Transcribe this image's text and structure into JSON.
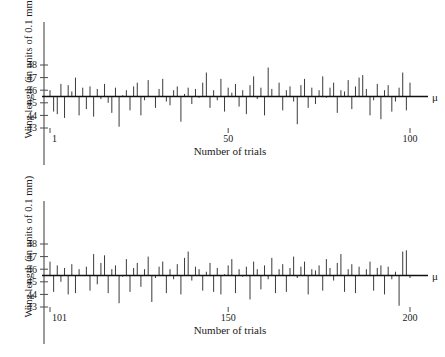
{
  "figure": {
    "type": "stem-plot-pair",
    "xlabel": "Number of trials",
    "ylabel": "Wing length (in units of 0.1 mm)",
    "mean_symbol": "μ",
    "line_color": "#3a3a3a",
    "axis_color": "#4a4a4a"
  },
  "chart_data": [
    {
      "type": "bar",
      "panel": "top",
      "title": "",
      "xlabel": "Number of trials",
      "ylabel": "Wing length (in units of 0.1 mm)",
      "xlim": [
        1,
        100
      ],
      "ylim": [
        43,
        48
      ],
      "baseline": 45.5,
      "baseline_label": "μ",
      "grid": false,
      "legend": null,
      "xticks": [
        1,
        50,
        100
      ],
      "xticklabels": [
        "1",
        "50",
        "100"
      ],
      "yticks": [
        43,
        44,
        45,
        46,
        47,
        48
      ],
      "yticklabels": [
        "43",
        "44",
        "45",
        "46",
        "47",
        "48"
      ],
      "categories": [
        1,
        2,
        3,
        4,
        5,
        6,
        7,
        8,
        9,
        10,
        11,
        12,
        13,
        14,
        15,
        16,
        17,
        18,
        19,
        20,
        21,
        22,
        23,
        24,
        25,
        26,
        27,
        28,
        29,
        30,
        31,
        32,
        33,
        34,
        35,
        36,
        37,
        38,
        39,
        40,
        41,
        42,
        43,
        44,
        45,
        46,
        47,
        48,
        49,
        50,
        51,
        52,
        53,
        54,
        55,
        56,
        57,
        58,
        59,
        60,
        61,
        62,
        63,
        64,
        65,
        66,
        67,
        68,
        69,
        70,
        71,
        72,
        73,
        74,
        75,
        76,
        77,
        78,
        79,
        80,
        81,
        82,
        83,
        84,
        85,
        86,
        87,
        88,
        89,
        90,
        91,
        92,
        93,
        94,
        95,
        96,
        97,
        98,
        99,
        100
      ],
      "values": [
        46.0,
        44.3,
        44.1,
        46.5,
        43.8,
        46.4,
        45.9,
        47.0,
        44.0,
        46.2,
        44.5,
        46.3,
        43.9,
        46.1,
        45.3,
        46.5,
        45.0,
        44.2,
        46.2,
        43.1,
        45.6,
        46.0,
        44.4,
        46.3,
        46.6,
        44.0,
        45.2,
        46.8,
        45.5,
        44.6,
        46.1,
        46.9,
        45.1,
        44.8,
        46.0,
        46.3,
        43.5,
        45.7,
        46.2,
        44.9,
        46.1,
        45.4,
        46.6,
        47.4,
        44.6,
        46.0,
        45.2,
        46.9,
        44.3,
        46.2,
        45.8,
        46.5,
        44.7,
        46.0,
        44.1,
        46.4,
        47.1,
        45.3,
        46.2,
        44.0,
        47.8,
        46.1,
        45.5,
        46.6,
        44.4,
        46.0,
        46.3,
        45.1,
        43.3,
        46.4,
        46.9,
        44.6,
        46.2,
        44.9,
        46.0,
        47.1,
        45.4,
        46.2,
        46.6,
        44.2,
        46.0,
        45.9,
        46.8,
        44.5,
        46.3,
        47.0,
        47.2,
        46.1,
        44.0,
        45.2,
        46.5,
        43.7,
        46.0,
        46.4,
        44.3,
        45.1,
        46.2,
        47.4,
        44.4,
        46.6
      ]
    },
    {
      "type": "bar",
      "panel": "bottom",
      "title": "",
      "xlabel": "Number of trials",
      "ylabel": "Wing length (in units of 0.1 mm)",
      "xlim": [
        101,
        200
      ],
      "ylim": [
        43,
        48
      ],
      "baseline": 45.5,
      "baseline_label": "μ",
      "grid": false,
      "legend": null,
      "xticks": [
        101,
        150,
        200
      ],
      "xticklabels": [
        "101",
        "150",
        "200"
      ],
      "yticks": [
        43,
        44,
        45,
        46,
        47,
        48
      ],
      "yticklabels": [
        "43",
        "44",
        "45",
        "46",
        "47",
        "48"
      ],
      "categories": [
        101,
        102,
        103,
        104,
        105,
        106,
        107,
        108,
        109,
        110,
        111,
        112,
        113,
        114,
        115,
        116,
        117,
        118,
        119,
        120,
        121,
        122,
        123,
        124,
        125,
        126,
        127,
        128,
        129,
        130,
        131,
        132,
        133,
        134,
        135,
        136,
        137,
        138,
        139,
        140,
        141,
        142,
        143,
        144,
        145,
        146,
        147,
        148,
        149,
        150,
        151,
        152,
        153,
        154,
        155,
        156,
        157,
        158,
        159,
        160,
        161,
        162,
        163,
        164,
        165,
        166,
        167,
        168,
        169,
        170,
        171,
        172,
        173,
        174,
        175,
        176,
        177,
        178,
        179,
        180,
        181,
        182,
        183,
        184,
        185,
        186,
        187,
        188,
        189,
        190,
        191,
        192,
        193,
        194,
        195,
        196,
        197,
        198,
        199,
        200
      ],
      "values": [
        46.6,
        44.2,
        46.3,
        45.0,
        46.1,
        44.0,
        46.4,
        44.1,
        46.0,
        45.5,
        46.2,
        44.3,
        47.2,
        44.8,
        46.5,
        47.1,
        44.1,
        46.0,
        46.3,
        43.3,
        45.4,
        46.8,
        44.2,
        46.1,
        46.5,
        44.6,
        46.0,
        47.0,
        43.4,
        45.3,
        46.2,
        46.6,
        44.1,
        46.0,
        45.2,
        46.4,
        44.0,
        46.9,
        47.4,
        45.1,
        46.2,
        46.0,
        44.3,
        45.8,
        46.5,
        44.2,
        46.1,
        44.0,
        45.6,
        46.3,
        46.8,
        44.1,
        46.0,
        45.4,
        46.2,
        43.6,
        46.6,
        46.0,
        44.4,
        46.3,
        45.2,
        46.9,
        44.1,
        46.0,
        46.4,
        44.2,
        46.1,
        47.0,
        45.3,
        46.2,
        46.6,
        44.0,
        46.0,
        45.9,
        46.3,
        44.3,
        46.8,
        46.1,
        45.1,
        46.5,
        47.2,
        44.2,
        46.0,
        46.4,
        44.1,
        46.2,
        45.5,
        46.0,
        46.6,
        44.3,
        46.1,
        46.3,
        44.0,
        46.2,
        45.2,
        45.8,
        43.1,
        47.4,
        47.5,
        45.3
      ]
    }
  ]
}
